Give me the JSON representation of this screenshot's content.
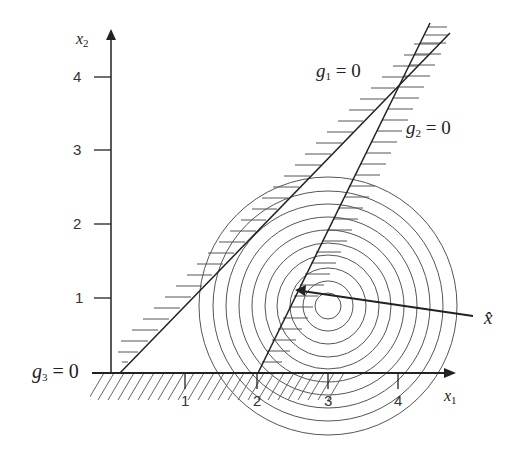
{
  "diagram": {
    "type": "constrained-optimization-contour-plot",
    "axes": {
      "x_label": "x",
      "x_label_sub": "1",
      "y_label": "x",
      "y_label_sub": "2",
      "x_ticks": [
        "1",
        "2",
        "3",
        "4"
      ],
      "y_ticks": [
        "1",
        "2",
        "3",
        "4"
      ]
    },
    "constraints": [
      {
        "id": "g1",
        "label_main": "g",
        "label_sub": "1",
        "label_rest": " = 0"
      },
      {
        "id": "g2",
        "label_main": "g",
        "label_sub": "2",
        "label_rest": " = 0"
      },
      {
        "id": "g3",
        "label_main": "g",
        "label_sub": "3",
        "label_rest": " = 0"
      }
    ],
    "objective": {
      "contours": "concentric circles",
      "center": [
        3,
        0.9
      ],
      "count": 10
    },
    "optimum": {
      "label": "x̂",
      "point": [
        2.2,
        1.0
      ]
    }
  }
}
